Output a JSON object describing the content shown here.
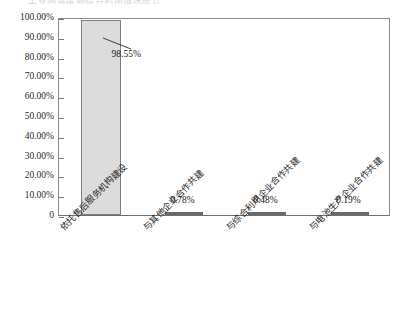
{
  "title_sliver": "工业固体废物综合利用情况统计",
  "chart_data": {
    "type": "bar",
    "title": "",
    "subtitle": "",
    "xlabel": "",
    "ylabel": "",
    "categories": [
      "依托售后服务机构建设",
      "与其他企业合作共建",
      "与综合利用企业合作共建",
      "与电池生产企业合作共建"
    ],
    "values": [
      98.55,
      0.78,
      0.48,
      0.19
    ],
    "value_labels": [
      "98.55%",
      "0.78%",
      "0.48%",
      "0.19%"
    ],
    "ylim": [
      0,
      100
    ],
    "ytick_values": [
      0,
      10,
      20,
      30,
      40,
      50,
      60,
      70,
      80,
      90,
      100
    ],
    "ytick_labels": [
      "0",
      "10.00%",
      "20.00%",
      "30.00%",
      "40.00%",
      "50.00%",
      "60.00%",
      "70.00%",
      "80.00%",
      "90.00%",
      "100.00%"
    ],
    "grid": false,
    "legend": "none",
    "series": [
      {
        "name": "占比",
        "values": [
          98.55,
          0.78,
          0.48,
          0.19
        ]
      }
    ],
    "colors": {
      "bar_major_fill": "#dcdcdc",
      "bar_major_border": "#7d7d7d",
      "bar_minor_fill": "#6a6a6a",
      "axis": "#8a8a8a",
      "text": "#1f1f1f"
    }
  }
}
